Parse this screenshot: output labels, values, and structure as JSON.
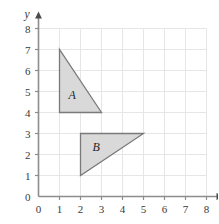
{
  "figure": {
    "type": "coordinate-grid-diagram",
    "background_color": "#ffffff",
    "grid_color": "#e6e6e6",
    "axis_color": "#8d8d8d",
    "shape_fill": "#d9d9d9",
    "shape_stroke": "#7a7a7a",
    "label_color": "#3a3a3a"
  },
  "axes": {
    "x": {
      "name": "x",
      "min": 0,
      "max": 8,
      "ticks": [
        "0",
        "1",
        "2",
        "3",
        "4",
        "5",
        "6",
        "7",
        "8"
      ],
      "arrow": true
    },
    "y": {
      "name": "y",
      "min": 0,
      "max": 8,
      "ticks": [
        "0",
        "1",
        "2",
        "3",
        "4",
        "5",
        "6",
        "7",
        "8"
      ],
      "arrow": true
    }
  },
  "shapes": [
    {
      "label": "A",
      "kind": "triangle",
      "vertices": [
        [
          1,
          7
        ],
        [
          1,
          4
        ],
        [
          3,
          4
        ]
      ],
      "right_angle_at": [
        1,
        4
      ],
      "label_position": [
        1.6,
        4.85
      ]
    },
    {
      "label": "B",
      "kind": "triangle",
      "vertices": [
        [
          2,
          3
        ],
        [
          2,
          1
        ],
        [
          5,
          3
        ]
      ],
      "right_angle_at": [
        2,
        3
      ],
      "label_position": [
        2.75,
        2.35
      ]
    }
  ]
}
